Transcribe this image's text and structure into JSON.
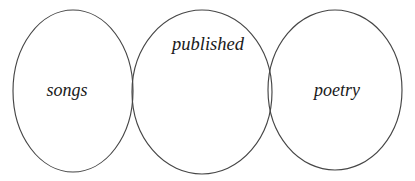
{
  "diagram": {
    "type": "venn",
    "kind": "three-circle-linear-venn",
    "background_color": "#ffffff",
    "stroke_color": "#464646",
    "stroke_width": 1.15,
    "text_color": "#1a1a1a",
    "width": 415,
    "height": 181,
    "sets": [
      {
        "id": "songs",
        "label": "songs",
        "cx": 73,
        "cy": 91,
        "rx": 60,
        "ry": 81,
        "label_x": 67,
        "label_y": 92
      },
      {
        "id": "published",
        "label": "published",
        "cx": 202,
        "cy": 92,
        "rx": 70,
        "ry": 82,
        "label_x": 208,
        "label_y": 46
      },
      {
        "id": "poetry",
        "label": "poetry",
        "cx": 335,
        "cy": 90,
        "rx": 67,
        "ry": 80,
        "label_x": 337,
        "label_y": 92
      }
    ],
    "overlaps": [
      {
        "between": [
          "songs",
          "published"
        ],
        "label": ""
      },
      {
        "between": [
          "published",
          "poetry"
        ],
        "label": ""
      }
    ]
  }
}
